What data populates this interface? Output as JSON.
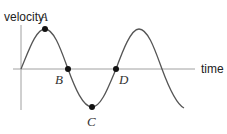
{
  "diagram": {
    "type": "velocity-time graph",
    "y_axis_label": "velocity",
    "x_axis_label": "time",
    "curve": "sinusoidal wave starting at origin",
    "points": [
      {
        "id": "A",
        "label": "A",
        "position": "maximum (crest)"
      },
      {
        "id": "B",
        "label": "B",
        "position": "zero crossing, descending"
      },
      {
        "id": "C",
        "label": "C",
        "position": "minimum (trough)"
      },
      {
        "id": "D",
        "label": "D",
        "position": "zero crossing, ascending"
      }
    ],
    "colors": {
      "curve": "#555555",
      "axes": "#999999",
      "points": "#111111",
      "text": "#222222"
    }
  }
}
